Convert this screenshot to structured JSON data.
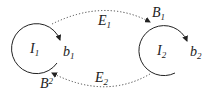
{
  "diagram": {
    "colors": {
      "stroke": "#222222",
      "dotted": "#444444",
      "background": "#ffffff"
    },
    "nodes": [
      {
        "id": "I1",
        "label": "I",
        "sub": "1",
        "out_label": {
          "base": "b",
          "sub": "1"
        },
        "in_label": {
          "base": "B",
          "sub": "2"
        }
      },
      {
        "id": "I2",
        "label": "I",
        "sub": "2",
        "out_label": {
          "base": "b",
          "sub": "2"
        },
        "in_label": {
          "base": "B",
          "sub": "1"
        }
      }
    ],
    "edges": [
      {
        "id": "E1",
        "label": "E",
        "sub": "1",
        "from": "I1",
        "to": "I2",
        "style": "dotted"
      },
      {
        "id": "E2",
        "label": "E",
        "sub": "2",
        "from": "I2",
        "to": "I1",
        "style": "dotted"
      }
    ]
  }
}
